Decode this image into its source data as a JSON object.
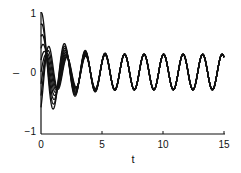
{
  "chart_data": {
    "type": "line",
    "title": "",
    "xlabel": "t",
    "ylabel": "–",
    "xlim": [
      0,
      15
    ],
    "ylim": [
      -1.1,
      1.1
    ],
    "x_ticks": [
      "0",
      "5",
      "10",
      "15"
    ],
    "y_ticks": [
      "-1",
      "0",
      "1"
    ],
    "grid": false,
    "legend": null,
    "series": [
      {
        "name": "x0=1.0",
        "initial": 1.0
      },
      {
        "name": "x0=0.8",
        "initial": 0.8
      },
      {
        "name": "x0=0.6",
        "initial": 0.6
      },
      {
        "name": "x0=0.4",
        "initial": 0.4
      },
      {
        "name": "x0=0.2",
        "initial": 0.2
      },
      {
        "name": "x0=0.0",
        "initial": 0.0
      },
      {
        "name": "x0=-0.2",
        "initial": -0.2
      },
      {
        "name": "x0=-0.4",
        "initial": -0.4
      },
      {
        "name": "x0=-0.6",
        "initial": -0.6
      }
    ],
    "steady_state": {
      "amplitude": 0.3,
      "period": 1.6,
      "offset": 0
    }
  },
  "labels": {
    "x_axis": "t",
    "y_axis": "–",
    "x_ticks": [
      "0",
      "5",
      "10",
      "15"
    ],
    "y_ticks": [
      "1",
      "0",
      "−1"
    ]
  }
}
